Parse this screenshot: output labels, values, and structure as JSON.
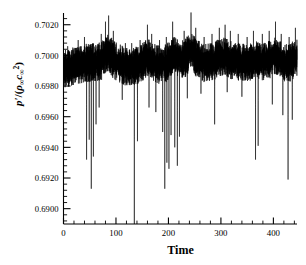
{
  "chart_data": {
    "type": "line",
    "title": "",
    "xlabel": "Time",
    "ylabel": "p'/(ρ∞ c∞²)",
    "ylabel_parts": {
      "numerator": "p'",
      "slash": "/(",
      "rho": "ρ",
      "rho_sub": "∞",
      "c": "c",
      "c_sub": "∞",
      "c_sup": "2",
      "close": ")"
    },
    "xlim": [
      0,
      445
    ],
    "ylim": [
      0.689,
      0.7027
    ],
    "xticks": [
      0,
      100,
      200,
      300,
      400
    ],
    "xtick_labels": [
      "0",
      "100",
      "200",
      "300",
      "400"
    ],
    "yticks": [
      0.69,
      0.692,
      0.694,
      0.696,
      0.698,
      0.7,
      0.702
    ],
    "ytick_labels": [
      "0.6900",
      "0.6920",
      "0.6940",
      "0.6960",
      "0.6980",
      "0.7000",
      "0.7020"
    ],
    "xminor_per_major": 5,
    "yminor_per_major": 5,
    "grid": false,
    "legend": null,
    "spines": [
      "left",
      "bottom"
    ],
    "line_color": "#000000",
    "line_width": 0.5,
    "background": "#ffffff",
    "series_name": "pressure fluctuation",
    "mean_level": 0.6996,
    "noise_band": [
      0.6986,
      0.7008
    ],
    "downward_spikes": [
      {
        "time": 44,
        "value": 0.6932
      },
      {
        "time": 49,
        "value": 0.6945
      },
      {
        "time": 53,
        "value": 0.6913
      },
      {
        "time": 57,
        "value": 0.6934
      },
      {
        "time": 62,
        "value": 0.6955
      },
      {
        "time": 68,
        "value": 0.6966
      },
      {
        "time": 112,
        "value": 0.6971
      },
      {
        "time": 135,
        "value": 0.689
      },
      {
        "time": 141,
        "value": 0.6944
      },
      {
        "time": 163,
        "value": 0.6966
      },
      {
        "time": 176,
        "value": 0.6963
      },
      {
        "time": 189,
        "value": 0.695
      },
      {
        "time": 193,
        "value": 0.6913
      },
      {
        "time": 197,
        "value": 0.693
      },
      {
        "time": 201,
        "value": 0.6926
      },
      {
        "time": 205,
        "value": 0.6948
      },
      {
        "time": 212,
        "value": 0.694
      },
      {
        "time": 217,
        "value": 0.6928
      },
      {
        "time": 221,
        "value": 0.6947
      },
      {
        "time": 236,
        "value": 0.6972
      },
      {
        "time": 262,
        "value": 0.6975
      },
      {
        "time": 288,
        "value": 0.6955
      },
      {
        "time": 312,
        "value": 0.6976
      },
      {
        "time": 340,
        "value": 0.6973
      },
      {
        "time": 366,
        "value": 0.6932
      },
      {
        "time": 371,
        "value": 0.6941
      },
      {
        "time": 398,
        "value": 0.6968
      },
      {
        "time": 418,
        "value": 0.6961
      },
      {
        "time": 428,
        "value": 0.6919
      },
      {
        "time": 436,
        "value": 0.6958
      }
    ],
    "peak_crests": [
      {
        "time": 8,
        "value": 0.7006
      },
      {
        "time": 28,
        "value": 0.701
      },
      {
        "time": 40,
        "value": 0.7012
      },
      {
        "time": 72,
        "value": 0.7014
      },
      {
        "time": 80,
        "value": 0.7022
      },
      {
        "time": 86,
        "value": 0.7026
      },
      {
        "time": 95,
        "value": 0.7016
      },
      {
        "time": 118,
        "value": 0.7008
      },
      {
        "time": 130,
        "value": 0.7008
      },
      {
        "time": 146,
        "value": 0.701
      },
      {
        "time": 160,
        "value": 0.702
      },
      {
        "time": 168,
        "value": 0.7014
      },
      {
        "time": 183,
        "value": 0.701
      },
      {
        "time": 196,
        "value": 0.7012
      },
      {
        "time": 208,
        "value": 0.7022
      },
      {
        "time": 230,
        "value": 0.7016
      },
      {
        "time": 243,
        "value": 0.7028
      },
      {
        "time": 252,
        "value": 0.7018
      },
      {
        "time": 268,
        "value": 0.7012
      },
      {
        "time": 283,
        "value": 0.7014
      },
      {
        "time": 297,
        "value": 0.7018
      },
      {
        "time": 308,
        "value": 0.702
      },
      {
        "time": 318,
        "value": 0.7016
      },
      {
        "time": 333,
        "value": 0.7014
      },
      {
        "time": 350,
        "value": 0.7012
      },
      {
        "time": 362,
        "value": 0.7016
      },
      {
        "time": 379,
        "value": 0.7014
      },
      {
        "time": 392,
        "value": 0.7016
      },
      {
        "time": 404,
        "value": 0.7022
      },
      {
        "time": 415,
        "value": 0.7014
      },
      {
        "time": 430,
        "value": 0.7012
      },
      {
        "time": 442,
        "value": 0.7018
      }
    ]
  },
  "axes": {
    "x_label_text": "Time"
  }
}
